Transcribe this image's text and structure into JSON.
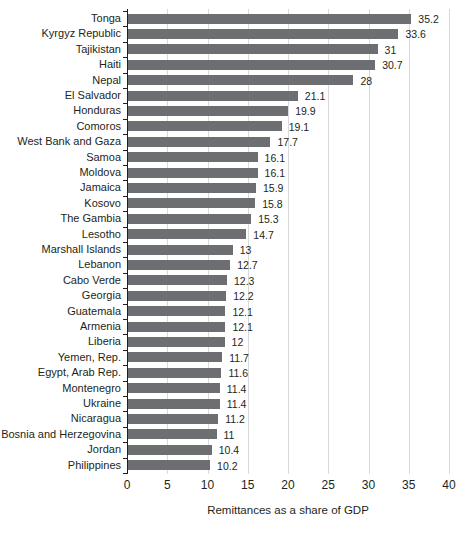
{
  "chart_data": {
    "type": "bar",
    "orientation": "horizontal",
    "title": "",
    "xlabel": "Remittances as a share of GDP",
    "ylabel": "",
    "xlim": [
      0,
      40
    ],
    "xticks": [
      0,
      5,
      10,
      15,
      20,
      25,
      30,
      35,
      40
    ],
    "grid": true,
    "legend": false,
    "categories": [
      "Tonga",
      "Kyrgyz Republic",
      "Tajikistan",
      "Haiti",
      "Nepal",
      "El Salvador",
      "Honduras",
      "Comoros",
      "West Bank and Gaza",
      "Samoa",
      "Moldova",
      "Jamaica",
      "Kosovo",
      "The Gambia",
      "Lesotho",
      "Marshall Islands",
      "Lebanon",
      "Cabo Verde",
      "Georgia",
      "Guatemala",
      "Armenia",
      "Liberia",
      "Yemen, Rep.",
      "Egypt, Arab Rep.",
      "Montenegro",
      "Ukraine",
      "Nicaragua",
      "Bosnia and Herzegovina",
      "Jordan",
      "Philippines"
    ],
    "values": [
      35.2,
      33.6,
      31,
      30.7,
      28,
      21.1,
      19.9,
      19.1,
      17.7,
      16.1,
      16.1,
      15.9,
      15.8,
      15.3,
      14.7,
      13,
      12.7,
      12.3,
      12.2,
      12.1,
      12.1,
      12,
      11.7,
      11.6,
      11.4,
      11.4,
      11.2,
      11,
      10.4,
      10.2
    ],
    "value_labels": [
      "35.2",
      "33.6",
      "31",
      "30.7",
      "28",
      "21.1",
      "19.9",
      "19.1",
      "17.7",
      "16.1",
      "16.1",
      "15.9",
      "15.8",
      "15.3",
      "14.7",
      "13",
      "12.7",
      "12.3",
      "12.2",
      "12.1",
      "12.1",
      "12",
      "11.7",
      "11.6",
      "11.4",
      "11.4",
      "11.2",
      "11",
      "10.4",
      "10.2"
    ],
    "colors": {
      "bar": "#6d6e71",
      "gridline": "#d9d9d9",
      "axis": "#231f20",
      "text": "#231f20"
    }
  }
}
